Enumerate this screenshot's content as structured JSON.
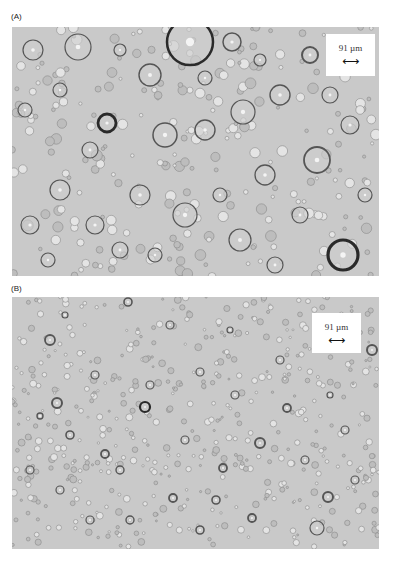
{
  "figure": {
    "panels": [
      {
        "label": "(A)",
        "scale_bar": {
          "text": "91 µm",
          "arrow": "⟷"
        },
        "bubbles": [
          [
            190,
            42,
            23,
            2.5
          ],
          [
            232,
            42,
            9,
            1.5
          ],
          [
            78,
            47,
            13,
            1.2
          ],
          [
            33,
            50,
            10,
            1.2
          ],
          [
            310,
            55,
            8,
            2
          ],
          [
            280,
            95,
            10,
            1.4
          ],
          [
            150,
            75,
            11,
            1.4
          ],
          [
            205,
            78,
            7,
            1.2
          ],
          [
            243,
            112,
            12,
            1.2
          ],
          [
            107,
            123,
            9,
            2.8
          ],
          [
            165,
            135,
            12,
            1.5
          ],
          [
            205,
            130,
            10,
            1.4
          ],
          [
            317,
            160,
            13,
            1.8
          ],
          [
            90,
            150,
            8,
            1.2
          ],
          [
            265,
            175,
            10,
            1.3
          ],
          [
            140,
            195,
            10,
            1.2
          ],
          [
            185,
            215,
            12,
            1.2
          ],
          [
            240,
            240,
            11,
            1.2
          ],
          [
            343,
            255,
            15,
            3.2
          ],
          [
            95,
            225,
            9,
            1.2
          ],
          [
            60,
            190,
            10,
            1.2
          ],
          [
            30,
            225,
            9,
            1.2
          ],
          [
            300,
            215,
            8,
            1.2
          ],
          [
            48,
            260,
            7,
            1.2
          ],
          [
            350,
            125,
            9,
            1.2
          ],
          [
            60,
            90,
            7,
            1.2
          ],
          [
            120,
            250,
            8,
            1.2
          ],
          [
            220,
            195,
            7,
            1.2
          ],
          [
            275,
            265,
            8,
            1.2
          ],
          [
            155,
            255,
            7,
            1.2
          ],
          [
            25,
            110,
            7,
            1.2
          ],
          [
            365,
            195,
            7,
            1.2
          ],
          [
            330,
            95,
            8,
            1.2
          ],
          [
            120,
            50,
            6,
            1.2
          ],
          [
            260,
            60,
            6,
            1.2
          ]
        ]
      },
      {
        "label": "(B)",
        "scale_bar": {
          "text": "91 µm",
          "arrow": "⟷"
        },
        "bubbles": [
          [
            50,
            340,
            5,
            1.8
          ],
          [
            128,
            302,
            4,
            1.6
          ],
          [
            57,
            403,
            5,
            2
          ],
          [
            145,
            407,
            5,
            2.2
          ],
          [
            40,
            416,
            3,
            1.4
          ],
          [
            70,
            435,
            4,
            1.6
          ],
          [
            105,
            454,
            4,
            1.8
          ],
          [
            260,
            443,
            5,
            2
          ],
          [
            223,
            468,
            4,
            1.8
          ],
          [
            173,
            498,
            4,
            1.8
          ],
          [
            216,
            500,
            4,
            1.6
          ],
          [
            328,
            497,
            5,
            2
          ],
          [
            252,
            518,
            4,
            1.8
          ],
          [
            372,
            350,
            5,
            2
          ],
          [
            287,
            408,
            4,
            1.8
          ],
          [
            317,
            528,
            7,
            1.2
          ],
          [
            200,
            372,
            4,
            1.2
          ],
          [
            150,
            385,
            4,
            1.2
          ],
          [
            95,
            375,
            4,
            1.2
          ],
          [
            235,
            395,
            4,
            1.2
          ],
          [
            305,
            460,
            4,
            1.2
          ],
          [
            345,
            430,
            4,
            1.2
          ],
          [
            130,
            520,
            4,
            1.4
          ],
          [
            90,
            520,
            4,
            1.2
          ],
          [
            185,
            440,
            4,
            1.2
          ],
          [
            60,
            490,
            4,
            1.2
          ],
          [
            30,
            470,
            4,
            1.2
          ],
          [
            355,
            480,
            4,
            1.2
          ],
          [
            120,
            470,
            4,
            1.4
          ],
          [
            280,
            360,
            4,
            1.2
          ],
          [
            170,
            325,
            4,
            1.2
          ],
          [
            65,
            315,
            3,
            1.2
          ],
          [
            230,
            330,
            3,
            1.2
          ],
          [
            330,
            395,
            3,
            1.2
          ],
          [
            200,
            530,
            4,
            1.6
          ]
        ]
      }
    ]
  }
}
